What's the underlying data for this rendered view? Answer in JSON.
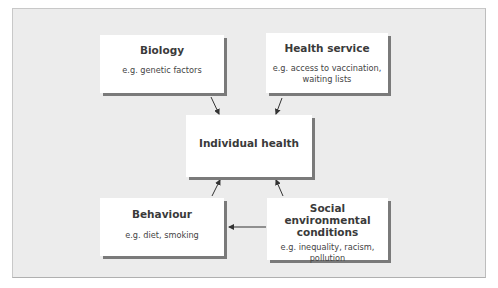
{
  "diagram": {
    "center": {
      "title": "Individual health"
    },
    "nodes": [
      {
        "id": "biology",
        "title": "Biology",
        "example": "e.g. genetic factors"
      },
      {
        "id": "health_service",
        "title": "Health service",
        "example_lines": [
          "e.g. access to vaccination,",
          "waiting lists"
        ]
      },
      {
        "id": "behaviour",
        "title": "Behaviour",
        "example": "e.g. diet, smoking"
      },
      {
        "id": "social",
        "title_lines": [
          "Social environmental",
          "conditions"
        ],
        "example_lines": [
          "e.g. inequality, racism,",
          "pollution"
        ]
      }
    ],
    "edges": [
      {
        "from": "biology",
        "to": "center"
      },
      {
        "from": "health_service",
        "to": "center"
      },
      {
        "from": "behaviour",
        "to": "center"
      },
      {
        "from": "social",
        "to": "center"
      },
      {
        "from": "social",
        "to": "behaviour"
      }
    ],
    "colors": {
      "background": "#ececec",
      "box": "#ffffff",
      "shadow": "#7a7a7a",
      "arrow": "#333333"
    }
  }
}
